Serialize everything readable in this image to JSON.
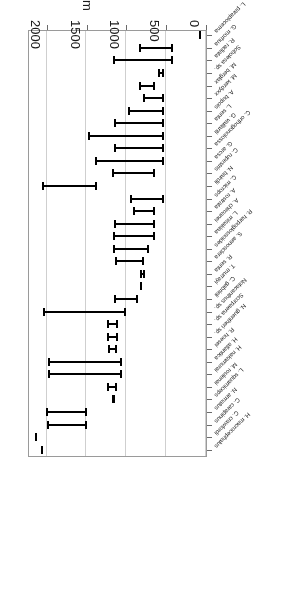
{
  "chart_data": {
    "type": "bar",
    "orientation": "horizontal-ranges",
    "title": "",
    "xlabel": "Depth, m",
    "ylabel": "",
    "xlim": [
      0,
      2250
    ],
    "xticks": [
      0,
      500,
      1000,
      1500,
      2000
    ],
    "xtick_labels": [
      "0",
      "500",
      "1000",
      "1500",
      "2000"
    ],
    "grid": "vertical",
    "legend": "none",
    "value_type": "depth range (min, max) in metres",
    "categories": [
      "H. macrocephalus",
      "C. crawfordi",
      "C. carapinus",
      "N. armatus",
      "L. squamiceps",
      "M. roulenai",
      "H. nakamurai",
      "H. atlantica",
      "R. hoesei",
      "N. guentheri sp.",
      "Scorpaena sp.",
      "Notacanthus sp.",
      "C. gabrieli",
      "T. murrayi",
      "R. senta",
      "S. aenosclera",
      "R. harpoglossoides",
      "L. misakiaa",
      "A. chiroanei",
      "A. rostrata",
      "C. microps",
      "N. bairdii",
      "C. rupestris",
      "G. arcsa",
      "C. orthogonolossa",
      "G. vaillanti",
      "L. senta",
      "A. bupois",
      "M. kerdyxx",
      "M. berglax",
      "Sobolesa sp.",
      "R. radiata",
      "G. morhua",
      "L. paraplocema"
    ],
    "ranges": [
      [
        2050,
        2080
      ],
      [
        2120,
        2150
      ],
      [
        1495,
        2005
      ],
      [
        1500,
        2005
      ],
      [
        1150,
        1180
      ],
      [
        1120,
        1240
      ],
      [
        1060,
        1985
      ],
      [
        1060,
        1985
      ],
      [
        1115,
        1235
      ],
      [
        1110,
        1240
      ],
      [
        1110,
        1240
      ],
      [
        1010,
        2050
      ],
      [
        850,
        1155
      ],
      [
        800,
        820
      ],
      [
        765,
        830
      ],
      [
        780,
        1150
      ],
      [
        720,
        1170
      ],
      [
        640,
        1175
      ],
      [
        635,
        1160
      ],
      [
        640,
        915
      ],
      [
        530,
        960
      ],
      [
        1375,
        2060
      ],
      [
        640,
        1180
      ],
      [
        530,
        1400
      ],
      [
        530,
        1155
      ],
      [
        530,
        1480
      ],
      [
        530,
        1160
      ],
      [
        530,
        980
      ],
      [
        530,
        790
      ],
      [
        640,
        840
      ],
      [
        530,
        605
      ],
      [
        420,
        1170
      ],
      [
        420,
        840
      ],
      [
        60,
        90
      ]
    ]
  },
  "axis": {
    "x_title": "Depth, m",
    "tick_labels": [
      "0",
      "500",
      "1000",
      "1500",
      "2000"
    ]
  }
}
